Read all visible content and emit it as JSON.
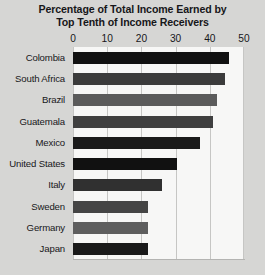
{
  "chart_data": {
    "type": "bar",
    "orientation": "horizontal",
    "title": "Percentage of Total Income Earned by Top Tenth of Income Receivers",
    "title_lines": [
      "Percentage of Total Income Earned by",
      "Top Tenth of Income Receivers"
    ],
    "xlabel": "",
    "ylabel": "",
    "xlim": [
      0,
      50
    ],
    "xticks": [
      0,
      10,
      20,
      30,
      40,
      50
    ],
    "xtick_labels": [
      "0",
      "10",
      "20",
      "30",
      "40",
      "50"
    ],
    "grid": "vertical",
    "legend": "none",
    "categories": [
      "Colombia",
      "South Africa",
      "Brazil",
      "Guatemala",
      "Mexico",
      "United States",
      "Italy",
      "Sweden",
      "Germany",
      "Japan"
    ],
    "values": [
      45.5,
      44.5,
      42,
      41,
      37,
      30.5,
      26,
      22,
      22,
      22
    ],
    "bar_colors": [
      "#111111",
      "#3b3b3b",
      "#5b5b5b",
      "#3f3f3f",
      "#1a1a1a",
      "#111111",
      "#303030",
      "#454545",
      "#5e5e5e",
      "#1a1a1a"
    ]
  },
  "style": {
    "page_background": "#d6d6d4",
    "plot_background": "#f7f7f6",
    "gridline_color": "#c6c6c4",
    "text_color": "#17171a"
  }
}
